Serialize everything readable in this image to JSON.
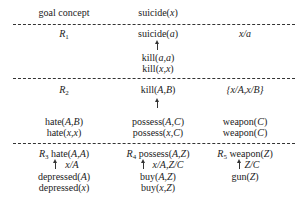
{
  "header": {
    "label": "goal concept",
    "goal": [
      "suicide(",
      "x",
      ")"
    ]
  },
  "r1": {
    "rule": "R",
    "rule_sub": "1",
    "head": [
      "suicide(",
      "a",
      ")"
    ],
    "body": [
      [
        "kill(",
        "a,a",
        ")"
      ],
      [
        "kill(",
        "x,x",
        ")"
      ]
    ],
    "subst": "x/a"
  },
  "r2": {
    "rule": "R",
    "rule_sub": "2",
    "head": [
      "kill(",
      "A,B",
      ")"
    ],
    "subst": "{x/A,x/B}",
    "left": [
      [
        "hate(",
        "A,B",
        ")"
      ],
      [
        "hate(",
        "x,x",
        ")"
      ]
    ],
    "mid": [
      [
        "possess(",
        "A,C",
        ")"
      ],
      [
        "possess(",
        "x,C",
        ")"
      ]
    ],
    "right": [
      [
        "weapon(",
        "C",
        ")"
      ],
      [
        "weapon(",
        "C",
        ")"
      ]
    ]
  },
  "bottom": {
    "r3": {
      "rule": "R",
      "rule_sub": "3",
      "head": [
        "hate(",
        "A,A",
        ")"
      ],
      "subst": "x/A",
      "body": [
        [
          "depressed(",
          "A",
          ")"
        ],
        [
          "depressed(",
          "x",
          ")"
        ]
      ]
    },
    "r4": {
      "rule": "R",
      "rule_sub": "4",
      "head": [
        "possess(",
        "A,Z",
        ")"
      ],
      "subst": "x/A,Z/C",
      "body": [
        [
          "buy(",
          "A,Z",
          ")"
        ],
        [
          "buy(",
          "x,Z",
          ")"
        ]
      ]
    },
    "r5": {
      "rule": "R",
      "rule_sub": "5",
      "head": [
        "weapon(",
        "Z",
        ")"
      ],
      "subst": "Z/C",
      "body": [
        [
          "gun(",
          "Z",
          ")"
        ]
      ]
    }
  }
}
